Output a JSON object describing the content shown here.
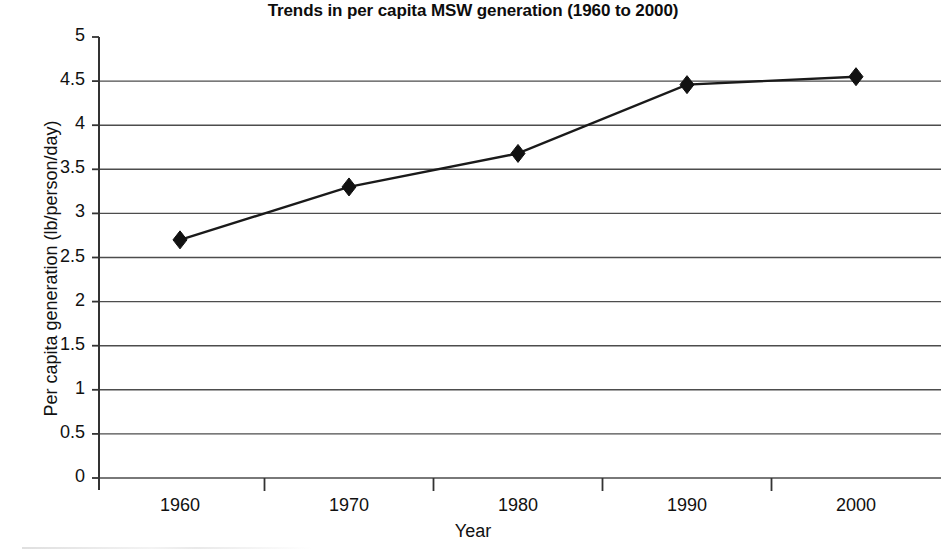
{
  "chart_data": {
    "type": "line",
    "title": "Trends in per capita MSW generation (1960 to 2000)",
    "xlabel": "Year",
    "ylabel": "Per capita generation (lb/person/day)",
    "categories": [
      "1960",
      "1970",
      "1980",
      "1990",
      "2000"
    ],
    "values": [
      2.7,
      3.3,
      3.68,
      4.46,
      4.55
    ],
    "series": [
      {
        "name": "Per capita MSW generation",
        "values": [
          2.7,
          3.3,
          3.68,
          4.46,
          4.55
        ]
      }
    ],
    "ylim": [
      0,
      5
    ],
    "ytick_labels": [
      "0",
      "0.5",
      "1",
      "1.5",
      "2",
      "2.5",
      "3",
      "3.5",
      "4",
      "4.5",
      "5"
    ],
    "ytick_values": [
      0,
      0.5,
      1,
      1.5,
      2,
      2.5,
      3,
      3.5,
      4,
      4.5,
      5
    ],
    "xtick_labels": [
      "1960",
      "1970",
      "1980",
      "1990",
      "2000"
    ],
    "grid": "horizontal",
    "legend": "none",
    "marker": "diamond",
    "line_color": "#1a1a1a",
    "marker_color": "#111111",
    "grid_color": "#4d4d4d",
    "axis_color": "#333333",
    "background_color": "#ffffff"
  }
}
